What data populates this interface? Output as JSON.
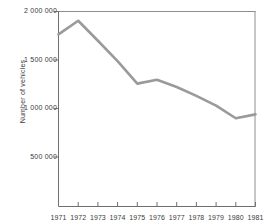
{
  "chart_data": {
    "type": "line",
    "title": "",
    "xlabel": "",
    "ylabel": "Number of vehicles",
    "categories": [
      "1971",
      "1972",
      "1973",
      "1974",
      "1975",
      "1976",
      "1977",
      "1978",
      "1979",
      "1980",
      "1981"
    ],
    "x": [
      1971,
      1972,
      1973,
      1974,
      1975,
      1976,
      1977,
      1978,
      1979,
      1980,
      1981
    ],
    "values": [
      1765000,
      1905000,
      1700000,
      1490000,
      1260000,
      1300000,
      1225000,
      1135000,
      1035000,
      905000,
      945000
    ],
    "series": [
      {
        "name": "Number of vehicles",
        "color": "#9a9a9a",
        "values": [
          1765000,
          1905000,
          1700000,
          1490000,
          1260000,
          1300000,
          1225000,
          1135000,
          1035000,
          905000,
          945000
        ]
      }
    ],
    "ylim": [
      0,
      2000000
    ],
    "xlim": [
      1971,
      1981
    ],
    "ytick_values": [
      500000,
      1000000,
      1500000,
      2000000
    ],
    "ytick_labels": [
      "500 000",
      "1 000 000",
      "1 500 000",
      "2 000 000"
    ],
    "xtick_labels": [
      "1971",
      "1972",
      "1973",
      "1974",
      "1975",
      "1976",
      "1977",
      "1978",
      "1979",
      "1980",
      "1981"
    ],
    "grid": false,
    "legend": "none",
    "axis_color": "#6f6f6f",
    "line_color": "#9a9a9a",
    "text_color": "#3a3a3a",
    "background": "#ffffff"
  }
}
